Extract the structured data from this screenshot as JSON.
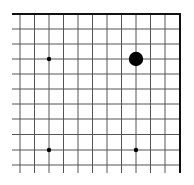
{
  "board": {
    "type": "go-board-corner",
    "corner": "top-right",
    "columns_visible": 12,
    "rows_visible": 11,
    "line_color": "#555555",
    "edge_color": "#111111",
    "background": "#ffffff",
    "grid": {
      "x": [
        20,
        34.5,
        49,
        63.5,
        78,
        92.5,
        107,
        121.5,
        136,
        150.5,
        165,
        180
      ],
      "y": [
        14,
        29,
        44,
        59,
        74,
        89,
        104,
        119,
        134.5,
        150,
        165
      ],
      "left_extent": 12,
      "bottom_extent": 173
    },
    "hoshi": [
      {
        "col": 2,
        "row": 3
      },
      {
        "col": 2,
        "row": 9
      },
      {
        "col": 8,
        "row": 9
      }
    ],
    "stones": [
      {
        "col": 8,
        "row": 3,
        "color": "black"
      }
    ]
  }
}
